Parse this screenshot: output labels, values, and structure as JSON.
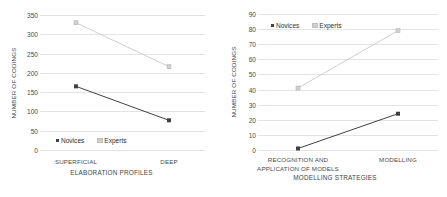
{
  "figure": {
    "background": "#ffffff",
    "gridline_color": "#e3e3e3",
    "series_colors": {
      "novices": "#404040",
      "experts": "#cfcfcf"
    }
  },
  "chart_data": [
    {
      "type": "line",
      "title": "",
      "xlabel": "ELABORATION PROFILES",
      "ylabel": "NUMBER OF CODINGS",
      "categories": [
        "SUPERFICIAL",
        "DEEP"
      ],
      "ylim": [
        0,
        350
      ],
      "yticks": [
        0,
        50,
        100,
        150,
        200,
        250,
        300,
        350
      ],
      "ytick_labels": [
        "0",
        "50",
        "100",
        "150",
        "200",
        "250",
        "300",
        "350"
      ],
      "grid": "horizontal",
      "legend_position": "inside-bottom-left",
      "series": [
        {
          "name": "Novices",
          "values": [
            165,
            77
          ],
          "color": "#404040",
          "marker": "square-filled"
        },
        {
          "name": "Experts",
          "values": [
            330,
            216
          ],
          "color": "#cfcfcf",
          "marker": "square-light"
        }
      ]
    },
    {
      "type": "line",
      "title": "",
      "xlabel": "MODELLING STRATEGIES",
      "ylabel": "NUMBER OF CODINGS",
      "categories": [
        "RECOGNITION AND APPLICATION OF MODELS",
        "MODELLING"
      ],
      "category_lines": [
        [
          "RECOGNITION AND",
          "APPLICATION OF MODELS"
        ],
        [
          "MODELLING"
        ]
      ],
      "ylim": [
        0,
        90
      ],
      "yticks": [
        0,
        10,
        20,
        30,
        40,
        50,
        60,
        70,
        80,
        90
      ],
      "ytick_labels": [
        "0",
        "10",
        "20",
        "30",
        "40",
        "50",
        "60",
        "70",
        "80",
        "90"
      ],
      "grid": "horizontal",
      "legend_position": "inside-top-left",
      "series": [
        {
          "name": "Novices",
          "values": [
            1,
            24
          ],
          "color": "#404040",
          "marker": "square-filled"
        },
        {
          "name": "Experts",
          "values": [
            41,
            79
          ],
          "color": "#cfcfcf",
          "marker": "square-light"
        }
      ]
    }
  ],
  "left_chart": {
    "ylabel": "NUMBER OF CODINGS",
    "xlabel": "ELABORATION PROFILES",
    "ytick_labels": [
      "350",
      "300",
      "250",
      "200",
      "150",
      "100",
      "50",
      "0"
    ],
    "xtick_labels": [
      "SUPERFICIAL",
      "DEEP"
    ],
    "legend": {
      "novices": "Novices",
      "experts": "Experts"
    }
  },
  "right_chart": {
    "ylabel": "NUMBER OF CODINGS",
    "xlabel": "MODELLING STRATEGIES",
    "ytick_labels": [
      "90",
      "80",
      "70",
      "60",
      "50",
      "40",
      "30",
      "20",
      "10",
      "0"
    ],
    "xtick_label_1_line_1": "RECOGNITION AND",
    "xtick_label_1_line_2": "APPLICATION OF MODELS",
    "xtick_label_2": "MODELLING",
    "legend": {
      "novices": "Novices",
      "experts": "Experts"
    }
  }
}
